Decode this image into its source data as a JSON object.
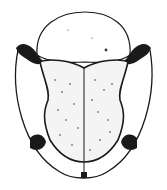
{
  "figure": {
    "colors": {
      "background": "#ffffff",
      "ink": "#1a1a1a",
      "stipple": "#333333"
    }
  }
}
